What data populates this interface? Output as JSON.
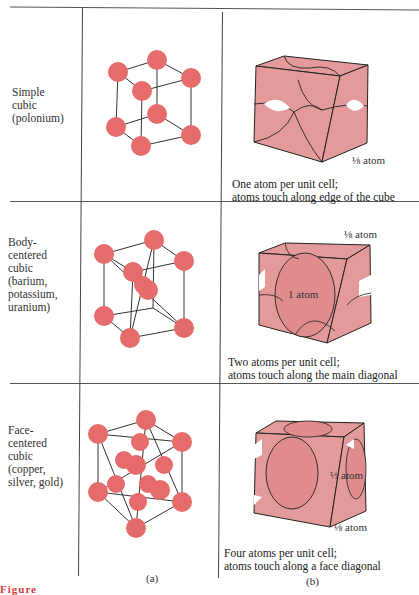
{
  "rows": [
    {
      "structure": "Simple cubic (polonium)",
      "label_lines": "Simple\ncubic\n(polonium)",
      "caption": "One atom per unit cell;\natoms touch along edge of the cube",
      "annotations": [
        "1/8 atom"
      ]
    },
    {
      "structure": "Body-centered cubic (barium, potassium, uranium)",
      "label_lines": "Body-\ncentered\ncubic\n(barium,\npotassium,\nuranium)",
      "caption": "Two atoms per unit cell;\natoms touch along the main diagonal",
      "annotations": [
        "1/8 atom",
        "1 atom"
      ]
    },
    {
      "structure": "Face-centered cubic (copper, silver, gold)",
      "label_lines": "Face-\ncentered\ncubic\n(copper,\nsilver, gold)",
      "caption": "Four atoms per unit cell;\natoms touch along a face diagonal",
      "annotations": [
        "1/2 atom",
        "1/8 atom"
      ]
    }
  ],
  "annotations": {
    "sc_corner": "⅛ atom",
    "bcc_corner": "⅛ atom",
    "bcc_center": "1 atom",
    "fcc_face": "½ atom",
    "fcc_corner": "⅛ atom"
  },
  "panels": {
    "a": "(a)",
    "b": "(b)"
  },
  "figure_caption_fragment": "Figure",
  "colors": {
    "atom_fill": "#e66b6b",
    "solid_fill": "#e49a9a",
    "line": "#333333",
    "fig_label": "#d23b3b"
  }
}
